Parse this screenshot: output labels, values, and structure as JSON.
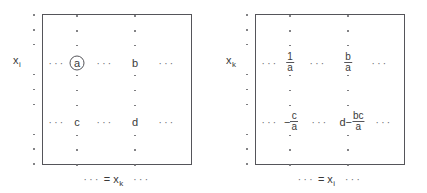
{
  "figure": {
    "ink_color": "#3a3a3a",
    "frame_color": "#55555a",
    "dot_color": "#6a6a6e",
    "ellipsis": "···",
    "equals": "="
  },
  "panels": [
    {
      "id": "before",
      "row_label_base": "x",
      "row_label_sub": "i",
      "col_label_base": "x",
      "col_label_sub": "k",
      "cells": [
        {
          "name": "pivot-a",
          "text": "a",
          "circled": true,
          "col": 1,
          "row": 1
        },
        {
          "name": "entry-b",
          "text": "b",
          "circled": false,
          "col": 2,
          "row": 1
        },
        {
          "name": "entry-c",
          "text": "c",
          "circled": false,
          "col": 1,
          "row": 2
        },
        {
          "name": "entry-d",
          "text": "d",
          "circled": false,
          "col": 2,
          "row": 2
        }
      ]
    },
    {
      "id": "after",
      "row_label_base": "x",
      "row_label_sub": "k",
      "col_label_base": "x",
      "col_label_sub": "i",
      "cells": [
        {
          "name": "entry-one-over-a",
          "lead": "",
          "num": "1",
          "den": "a",
          "col": 1,
          "row": 1
        },
        {
          "name": "entry-b-over-a",
          "lead": "",
          "num": "b",
          "den": "a",
          "col": 2,
          "row": 1
        },
        {
          "name": "entry-neg-c-over-a",
          "lead": "−",
          "num": "c",
          "den": "a",
          "col": 1,
          "row": 2
        },
        {
          "name": "entry-d-minus-bc-over-a",
          "lead": "d−",
          "num": "bc",
          "den": "a",
          "col": 2,
          "row": 2
        }
      ]
    }
  ]
}
